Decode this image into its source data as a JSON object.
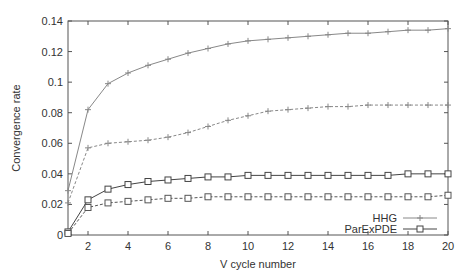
{
  "chart_data": {
    "type": "line",
    "title": "",
    "xlabel": "V cycle number",
    "ylabel": "Convergence rate",
    "xlim": [
      1,
      20
    ],
    "ylim": [
      0,
      0.14
    ],
    "xticks": [
      2,
      4,
      6,
      8,
      10,
      12,
      14,
      16,
      18,
      20
    ],
    "xtick_labels": [
      "2",
      "4",
      "6",
      "8",
      "10",
      "12",
      "14",
      "16",
      "18",
      "20"
    ],
    "yticks": [
      0,
      0.02,
      0.04,
      0.06,
      0.08,
      0.1,
      0.12,
      0.14
    ],
    "ytick_labels": [
      "0",
      "0.02",
      "0.04",
      "0.06",
      "0.08",
      "0.1",
      "0.12",
      "0.14"
    ],
    "grid": false,
    "legend_position": "lower right",
    "x": [
      1,
      2,
      3,
      4,
      5,
      6,
      7,
      8,
      9,
      10,
      11,
      12,
      13,
      14,
      15,
      16,
      17,
      18,
      19,
      20
    ],
    "series": [
      {
        "name": "HHG",
        "style": "solid",
        "marker": "plus",
        "color": "#888888",
        "in_legend": true,
        "values": [
          0.029,
          0.082,
          0.099,
          0.106,
          0.111,
          0.115,
          0.119,
          0.122,
          0.125,
          0.127,
          0.128,
          0.129,
          0.13,
          0.131,
          0.132,
          0.132,
          0.133,
          0.134,
          0.134,
          0.135
        ]
      },
      {
        "name": "HHG (dashed)",
        "style": "dashed",
        "marker": "plus",
        "color": "#888888",
        "in_legend": false,
        "values": [
          0.021,
          0.057,
          0.06,
          0.061,
          0.062,
          0.064,
          0.067,
          0.071,
          0.075,
          0.078,
          0.081,
          0.082,
          0.083,
          0.084,
          0.084,
          0.085,
          0.085,
          0.085,
          0.085,
          0.085
        ]
      },
      {
        "name": "ParExPDE",
        "style": "solid",
        "marker": "square",
        "color": "#444444",
        "in_legend": true,
        "values": [
          0.002,
          0.023,
          0.03,
          0.033,
          0.035,
          0.036,
          0.037,
          0.038,
          0.038,
          0.039,
          0.039,
          0.039,
          0.039,
          0.039,
          0.039,
          0.039,
          0.039,
          0.04,
          0.04,
          0.04
        ]
      },
      {
        "name": "ParExPDE (dashed)",
        "style": "dashed",
        "marker": "square",
        "color": "#555555",
        "in_legend": false,
        "values": [
          0.001,
          0.018,
          0.021,
          0.022,
          0.023,
          0.024,
          0.024,
          0.025,
          0.025,
          0.025,
          0.025,
          0.025,
          0.025,
          0.025,
          0.025,
          0.025,
          0.025,
          0.025,
          0.025,
          0.026
        ]
      }
    ]
  },
  "legend": {
    "items": [
      {
        "label": "HHG"
      },
      {
        "label": "ParExPDE"
      }
    ]
  },
  "colors": {
    "axis": "#555555",
    "hhg": "#888888",
    "parexpde": "#444444",
    "text": "#333333"
  }
}
